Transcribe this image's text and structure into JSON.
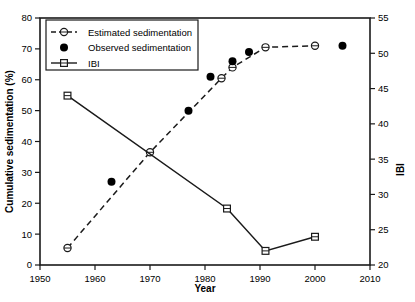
{
  "chart_data": {
    "type": "line",
    "title": "",
    "xlabel": "Year",
    "ylabel": "Cumulative sedimentation (%)",
    "y2label": "IBI",
    "xlim": [
      1950,
      2010
    ],
    "ylim": [
      0,
      80
    ],
    "y2lim": [
      20,
      55
    ],
    "xticks": [
      1950,
      1960,
      1970,
      1980,
      1990,
      2000,
      2010
    ],
    "yticks": [
      0,
      10,
      20,
      30,
      40,
      50,
      60,
      70,
      80
    ],
    "y2ticks": [
      20,
      25,
      30,
      35,
      40,
      45,
      50,
      55
    ],
    "grid": false,
    "legend_position": "top-left",
    "series": [
      {
        "name": "Estimated sedimentation",
        "axis": "left",
        "marker": "open-circle",
        "linestyle": "dashed",
        "points": [
          {
            "x": 1955,
            "y": 5.5
          },
          {
            "x": 1970,
            "y": 36.5
          },
          {
            "x": 1983,
            "y": 60.5
          },
          {
            "x": 1985,
            "y": 64.0
          },
          {
            "x": 1991,
            "y": 70.5
          },
          {
            "x": 2000,
            "y": 71.0
          }
        ]
      },
      {
        "name": "Observed sedimentation",
        "axis": "left",
        "marker": "filled-circle",
        "linestyle": "none",
        "points": [
          {
            "x": 1963,
            "y": 27.0
          },
          {
            "x": 1977,
            "y": 50.0
          },
          {
            "x": 1981,
            "y": 61.0
          },
          {
            "x": 1985,
            "y": 66.0
          },
          {
            "x": 1988,
            "y": 69.0
          },
          {
            "x": 2005,
            "y": 71.0
          }
        ]
      },
      {
        "name": "IBI",
        "axis": "right",
        "marker": "open-square",
        "linestyle": "solid",
        "points": [
          {
            "x": 1955,
            "y": 44.0
          },
          {
            "x": 1984,
            "y": 28.0
          },
          {
            "x": 1991,
            "y": 22.0
          },
          {
            "x": 2000,
            "y": 24.0
          }
        ]
      }
    ],
    "legend": [
      {
        "label": "Estimated sedimentation",
        "marker": "open-circle",
        "linestyle": "dashed"
      },
      {
        "label": "Observed sedimentation",
        "marker": "filled-circle",
        "linestyle": "none"
      },
      {
        "label": "IBI",
        "marker": "open-square",
        "linestyle": "solid"
      }
    ]
  }
}
